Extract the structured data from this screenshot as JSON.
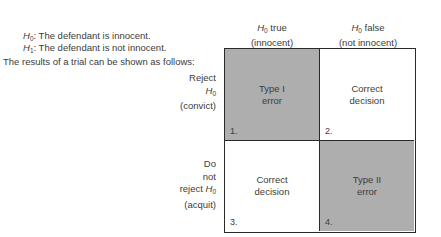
{
  "hypotheses": {
    "h0": {
      "symbol": "H",
      "sub": "0",
      "text": ": The defendant is innocent."
    },
    "h1": {
      "symbol": "H",
      "sub": "1",
      "text": ": The defendant is not innocent."
    }
  },
  "intro": "The results of a trial can be shown as follows:",
  "columns": [
    {
      "symbol": "H",
      "sub": "0",
      "text": " true",
      "note": "(innocent)"
    },
    {
      "symbol": "H",
      "sub": "0",
      "text": " false",
      "note": "(not innocent)"
    }
  ],
  "rows": [
    {
      "line1": "Reject",
      "symbol": "H",
      "sub": "0",
      "note": "(convict)"
    },
    {
      "line1": "Do",
      "line2": "not",
      "line3": "reject ",
      "symbol": "H",
      "sub": "0",
      "note": "(acquit)"
    }
  ],
  "cells": [
    {
      "number": "1.",
      "line1": "Type I",
      "line2": "error",
      "shaded": true
    },
    {
      "number": "2.",
      "line1": "Correct",
      "line2": "decision",
      "shaded": false
    },
    {
      "number": "3.",
      "line1": "Correct",
      "line2": "decision",
      "shaded": false
    },
    {
      "number": "4.",
      "line1": "Type II",
      "line2": "error",
      "shaded": true
    }
  ],
  "colors": {
    "shaded": "#aeaeae",
    "border": "#2a2a2a",
    "text": "#3c3c3c"
  }
}
